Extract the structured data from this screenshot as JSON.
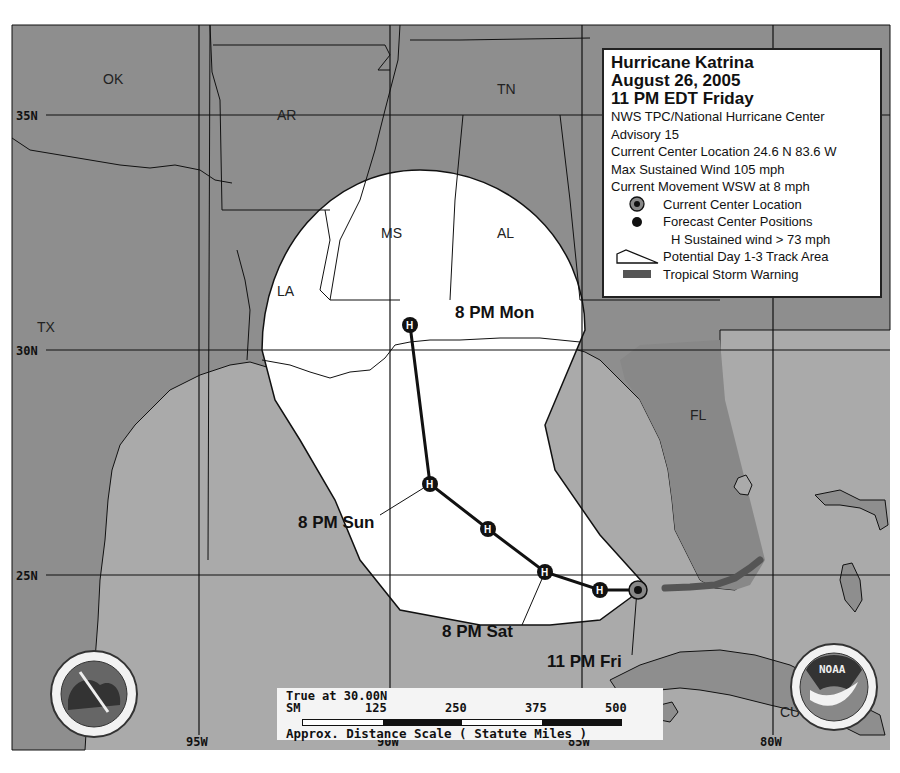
{
  "legend": {
    "title_line1": "Hurricane Katrina",
    "title_line2": "August 26, 2005",
    "title_line3": "11 PM EDT Friday",
    "agency": "NWS TPC/National Hurricane Center",
    "advisory": "Advisory 15",
    "location": "Current Center Location 24.6 N 83.6 W",
    "max_wind": "Max Sustained Wind 105 mph",
    "movement": "Current Movement WSW at 8 mph",
    "items": [
      {
        "icon": "current-center-icon",
        "label": "Current Center Location"
      },
      {
        "icon": "forecast-center-icon",
        "label": "Forecast Center Positions"
      },
      {
        "icon": "h-symbol",
        "label": "H  Sustained wind > 73 mph"
      },
      {
        "icon": "track-area-icon",
        "label": "Potential Day 1-3 Track Area"
      },
      {
        "icon": "tropical-storm-warning-icon",
        "label": "Tropical Storm Warning"
      }
    ]
  },
  "map": {
    "colors": {
      "land": "#8e8e8e",
      "water": "#aaaaaa",
      "cone": "#ffffff",
      "warning": "#555555",
      "grid": "#111111"
    },
    "lat_labels": [
      "35N",
      "30N",
      "25N"
    ],
    "lon_labels": [
      "95W",
      "90W",
      "85W",
      "80W"
    ],
    "state_labels": [
      "OK",
      "AR",
      "TN",
      "MS",
      "AL",
      "LA",
      "TX",
      "FL",
      "CU"
    ],
    "forecast_labels": {
      "mon": "8 PM Mon",
      "sun": "8 PM Sun",
      "sat": "8 PM Sat",
      "fri": "11 PM Fri"
    },
    "h_symbol": "H"
  },
  "scale": {
    "true_at": "True at 30.00N",
    "unit": "SM",
    "ticks": [
      "125",
      "250",
      "375",
      "500"
    ],
    "caption": "Approx. Distance Scale ( Statute Miles )"
  },
  "logos": {
    "nws": "NATIONAL WEATHER SERVICE",
    "noaa": "NOAA"
  }
}
